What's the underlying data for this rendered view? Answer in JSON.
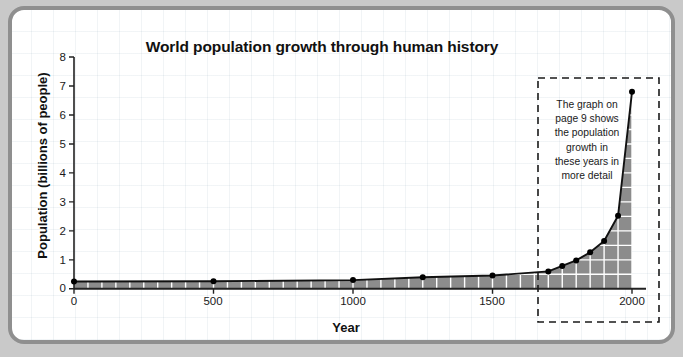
{
  "chart_data": {
    "type": "area",
    "title": "World population growth through human history",
    "xlabel": "Year",
    "ylabel": "Population (billions of people)",
    "xlim": [
      0,
      2050
    ],
    "ylim": [
      0,
      8
    ],
    "xticks": [
      "0",
      "500",
      "1000",
      "1500",
      "2000"
    ],
    "xtick_values": [
      0,
      500,
      1000,
      1500,
      2000
    ],
    "yticks": [
      "0",
      "1",
      "2",
      "3",
      "4",
      "5",
      "6",
      "7",
      "8"
    ],
    "ytick_values": [
      0,
      1,
      2,
      3,
      4,
      5,
      6,
      7,
      8
    ],
    "grid": true,
    "legend": "none",
    "series": [
      {
        "name": "World population",
        "x": [
          0,
          500,
          1000,
          1250,
          1500,
          1700,
          1750,
          1800,
          1850,
          1900,
          1950,
          2000
        ],
        "values": [
          0.25,
          0.26,
          0.3,
          0.4,
          0.46,
          0.6,
          0.79,
          0.98,
          1.26,
          1.65,
          2.52,
          6.8
        ]
      }
    ],
    "annotations": [
      {
        "name": "page-9-callout",
        "text": "The graph on page 9 shows the population growth in these years in more detail",
        "style": "dashed-box",
        "x_range": [
          1650,
          2050
        ],
        "y_range": [
          0,
          7.6
        ]
      }
    ],
    "colors": {
      "area_fill": "#8c8c8c",
      "line": "#111111",
      "marker": "#000000",
      "gridline": "#ffffff",
      "axis": "#222222",
      "frame": "#8f8f8f",
      "background": "#ffffff"
    }
  },
  "annotation": {
    "line1": "The graph on",
    "line2": "page 9 shows",
    "line3": "the population",
    "line4": "growth in",
    "line5": "these years in",
    "line6": "more detail"
  }
}
